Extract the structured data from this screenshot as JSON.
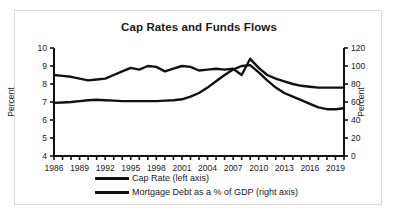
{
  "chart_data": {
    "type": "line",
    "title": "Cap Rates and Funds Flows",
    "xlabel": "",
    "ylabel": "Percent",
    "ylabel_right": "Percent",
    "grid": false,
    "legend_position": "bottom",
    "xlim": [
      1986,
      2020
    ],
    "ylim": [
      4,
      10
    ],
    "ylim_right": [
      0,
      120
    ],
    "yticks": [
      4,
      5,
      6,
      7,
      8,
      9,
      10
    ],
    "yticks_right": [
      0,
      20,
      40,
      60,
      80,
      100,
      120
    ],
    "xticks": [
      1986,
      1989,
      1992,
      1995,
      1998,
      2001,
      2004,
      2007,
      2010,
      2013,
      2016,
      2019
    ],
    "xtick_labels": [
      "1986",
      "1989",
      "1992",
      "1995",
      "1998",
      "2001",
      "2004",
      "2007",
      "2010",
      "2013",
      "2016",
      "2019"
    ],
    "x": [
      1986,
      1987,
      1988,
      1989,
      1990,
      1991,
      1992,
      1993,
      1994,
      1995,
      1996,
      1997,
      1998,
      1999,
      2000,
      2001,
      2002,
      2003,
      2004,
      2005,
      2006,
      2007,
      2008,
      2009,
      2010,
      2011,
      2012,
      2013,
      2014,
      2015,
      2016,
      2017,
      2018,
      2019,
      2020
    ],
    "series": [
      {
        "name": "Cap Rate (left axis)",
        "axis": "left",
        "color": "#111111",
        "unit": "percent",
        "values": [
          8.5,
          8.45,
          8.4,
          8.3,
          8.2,
          8.25,
          8.3,
          8.5,
          8.7,
          8.9,
          8.8,
          9.0,
          8.95,
          8.7,
          8.85,
          9.0,
          8.95,
          8.75,
          8.8,
          8.85,
          8.8,
          8.85,
          8.5,
          9.4,
          8.9,
          8.5,
          8.3,
          8.15,
          8.0,
          7.9,
          7.85,
          7.8,
          7.8,
          7.8,
          7.8
        ]
      },
      {
        "name": "Mortgage Debt as a % of GDP (right axis)",
        "axis": "right",
        "color": "#111111",
        "unit": "percent_of_gdp",
        "values": [
          59,
          59.5,
          60,
          61,
          62,
          62.5,
          62,
          61.5,
          61,
          61,
          61,
          61,
          61,
          61.5,
          62,
          63,
          66,
          70,
          76,
          83,
          90,
          96,
          100,
          101,
          93,
          84,
          76,
          70,
          66,
          62,
          58,
          54,
          52,
          52,
          53
        ]
      }
    ],
    "annotations": []
  },
  "legend": {
    "items": [
      {
        "label": "Cap Rate (left axis)"
      },
      {
        "label": "Mortgage Debt as a % of GDP (right axis)"
      }
    ]
  }
}
